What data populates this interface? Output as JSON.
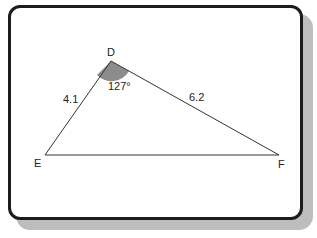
{
  "diagram": {
    "type": "triangle",
    "vertices": [
      {
        "name": "D",
        "x": 111,
        "y": 61
      },
      {
        "name": "E",
        "x": 45,
        "y": 155
      },
      {
        "name": "F",
        "x": 279,
        "y": 155
      }
    ],
    "sides": [
      {
        "between": "D-E",
        "label": "4.1"
      },
      {
        "between": "D-F",
        "label": "6.2"
      }
    ],
    "angle": {
      "at": "D",
      "label": "127°",
      "fill": "#8c8c8c"
    },
    "labels": {
      "D": "D",
      "E": "E",
      "F": "F",
      "DE": "4.1",
      "DF": "6.2",
      "angleD": "127°"
    }
  }
}
